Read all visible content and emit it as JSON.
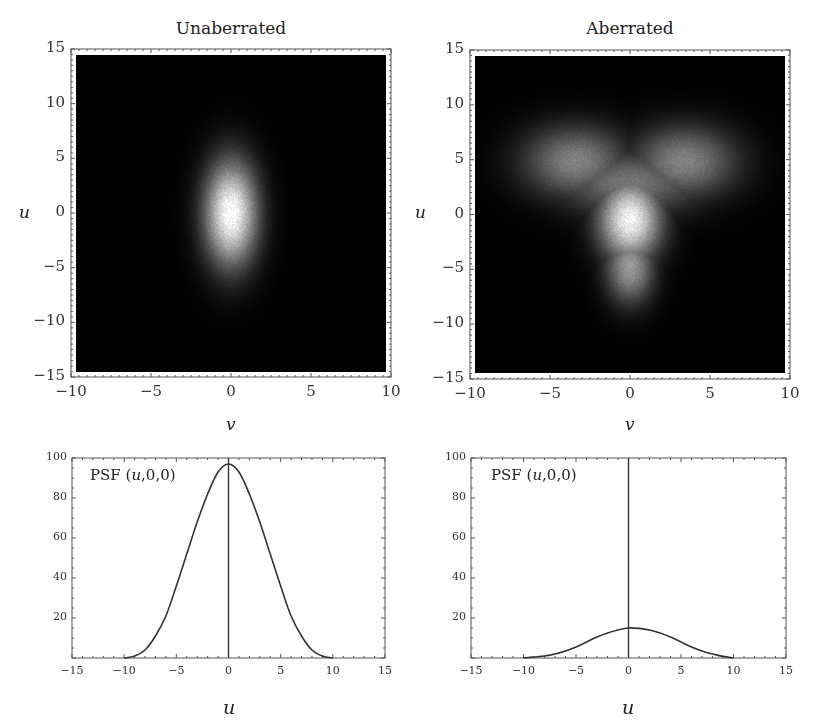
{
  "chart_data": [
    {
      "type": "heatmap",
      "title": "Unaberrated",
      "xlabel": "v",
      "ylabel": "u",
      "xlim": [
        -10,
        10
      ],
      "ylim": [
        -15,
        15
      ],
      "xticks": [
        "−10",
        "−5",
        "0",
        "5",
        "10"
      ],
      "yticks": [
        "15",
        "10",
        "5",
        "0",
        "−5",
        "−10",
        "−15"
      ],
      "description": "Single bright vertical elliptical spot centred at (0,0), extent roughly v∈[-2,2], u∈[-6,6]",
      "blobs": [
        {
          "v": 0,
          "u": 0,
          "sigma_v": 1.1,
          "sigma_u": 3.2,
          "peak": 1.0
        }
      ]
    },
    {
      "type": "heatmap",
      "title": "Aberrated",
      "xlabel": "v",
      "ylabel": "u",
      "xlim": [
        -10,
        10
      ],
      "ylim": [
        -15,
        15
      ],
      "xticks": [
        "−10",
        "−5",
        "0",
        "5",
        "10"
      ],
      "yticks": [
        "15",
        "10",
        "5",
        "0",
        "−5",
        "−10",
        "−15"
      ],
      "description": "Trefoil / heart-shaped PSF: bright core near (0,-0.5) with tail down to u≈-8 and two lobes toward (±4, 5)",
      "blobs": [
        {
          "v": 0,
          "u": -0.5,
          "sigma_v": 1.3,
          "sigma_u": 2.5,
          "peak": 0.95
        },
        {
          "v": 0,
          "u": -5,
          "sigma_v": 1.0,
          "sigma_u": 2.2,
          "peak": 0.55
        },
        {
          "v": -3.5,
          "u": 5,
          "sigma_v": 2.2,
          "sigma_u": 2.2,
          "peak": 0.45
        },
        {
          "v": 3.5,
          "u": 5,
          "sigma_v": 2.2,
          "sigma_u": 2.2,
          "peak": 0.45
        },
        {
          "v": 0,
          "u": 3,
          "sigma_v": 3.0,
          "sigma_u": 2.0,
          "peak": 0.4
        }
      ]
    },
    {
      "type": "line",
      "annotation": "PSF (u,0,0)",
      "xlabel": "u",
      "xlim": [
        -15,
        15
      ],
      "ylim": [
        0,
        100
      ],
      "xticks": [
        "−15",
        "−10",
        "−5",
        "0",
        "5",
        "10",
        "15"
      ],
      "yticks": [
        "100",
        "80",
        "60",
        "40",
        "20"
      ],
      "x": [
        -10,
        -9,
        -8,
        -7,
        -6,
        -5,
        -4,
        -3,
        -2,
        -1,
        0,
        1,
        2,
        3,
        4,
        5,
        6,
        7,
        8,
        9,
        10
      ],
      "values": [
        0,
        1,
        4,
        11,
        21,
        36,
        52,
        68,
        82,
        93,
        97,
        93,
        82,
        68,
        52,
        36,
        21,
        11,
        4,
        1,
        0
      ],
      "vertical_line_at": 0
    },
    {
      "type": "line",
      "annotation": "PSF (u,0,0)",
      "xlabel": "u",
      "xlim": [
        -15,
        15
      ],
      "ylim": [
        0,
        100
      ],
      "xticks": [
        "−15",
        "−10",
        "−5",
        "0",
        "5",
        "10",
        "15"
      ],
      "yticks": [
        "100",
        "80",
        "60",
        "40",
        "20"
      ],
      "x": [
        -10,
        -9,
        -8,
        -7,
        -6,
        -5,
        -4,
        -3,
        -2,
        -1,
        0,
        1,
        2,
        3,
        4,
        5,
        6,
        7,
        8,
        9,
        10
      ],
      "values": [
        0,
        0.5,
        1,
        2,
        3.5,
        5.5,
        8,
        10.5,
        12.5,
        14,
        15,
        14.8,
        14,
        12.5,
        10.5,
        8,
        5.5,
        3.5,
        2,
        0.8,
        0
      ],
      "vertical_line_at": 0
    }
  ],
  "panels": {
    "top_left": {
      "title": "Unaberrated",
      "xlabel": "v",
      "ylabel": "u"
    },
    "top_right": {
      "title": "Aberrated",
      "xlabel": "v",
      "ylabel": "u"
    },
    "bottom_left": {
      "annotation_prefix": "PSF (",
      "annotation_var": "u",
      "annotation_suffix": ",0,0)",
      "xlabel": "u"
    },
    "bottom_right": {
      "annotation_prefix": "PSF (",
      "annotation_var": "u",
      "annotation_suffix": ",0,0)",
      "xlabel": "u"
    }
  }
}
